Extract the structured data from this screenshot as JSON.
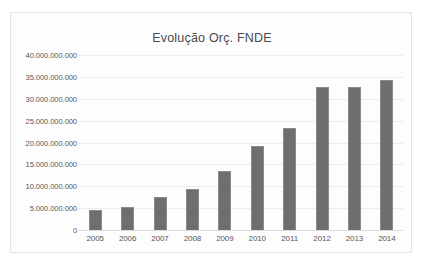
{
  "chart_data": {
    "type": "bar",
    "title": "Evolução Orç. FNDE",
    "xlabel": "",
    "ylabel": "",
    "categories": [
      "2005",
      "2006",
      "2007",
      "2008",
      "2009",
      "2010",
      "2011",
      "2012",
      "2013",
      "2014"
    ],
    "values": [
      4500000000,
      5300000000,
      7600000000,
      9400000000,
      13500000000,
      19200000000,
      23300000000,
      32600000000,
      32800000000,
      34200000000
    ],
    "ylim": [
      0,
      40000000000
    ],
    "ytick_values": [
      0,
      5000000000,
      10000000000,
      15000000000,
      20000000000,
      25000000000,
      30000000000,
      35000000000,
      40000000000
    ],
    "ytick_labels": [
      "0",
      "5.000.000.000",
      "10.000.000.000",
      "15.000.000.000",
      "20.000.000.000",
      "25.000.000.000",
      "30.000.000.000",
      "35.000.000.000",
      "40.000.000.000"
    ],
    "grid": true,
    "legend": false,
    "legend_position": "none",
    "bar_color": "#6e6e6e",
    "bar_edge_color": "#8b8b8b",
    "gridline_color": "#ececec",
    "plot_background": "#fdfdfd",
    "frame_border_color": "#e3e3e3",
    "title_color": "#4a4a4a",
    "tick_label_color": "#565656"
  }
}
